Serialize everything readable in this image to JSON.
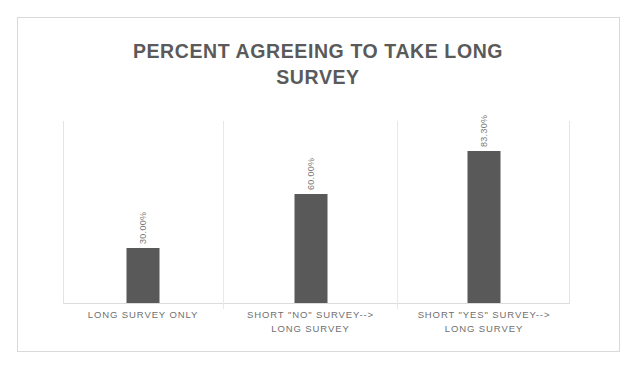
{
  "chart_data": {
    "type": "bar",
    "title": "PERCENT AGREEING TO TAKE LONG SURVEY",
    "title_line_1": "PERCENT AGREEING TO TAKE LONG",
    "title_line_2": "SURVEY",
    "categories": [
      "LONG SURVEY ONLY",
      "SHORT \"NO\" SURVEY--> LONG SURVEY",
      "SHORT \"YES\" SURVEY--> LONG SURVEY"
    ],
    "category_lines": [
      {
        "line_1": "LONG SURVEY ONLY",
        "line_2": ""
      },
      {
        "line_1": "SHORT \"NO\" SURVEY-->",
        "line_2": "LONG SURVEY"
      },
      {
        "line_1": "SHORT \"YES\" SURVEY-->",
        "line_2": "LONG SURVEY"
      }
    ],
    "values": [
      30.0,
      60.0,
      83.3
    ],
    "data_labels": [
      "30.00%",
      "60.00%",
      "83.30%"
    ],
    "xlabel": "",
    "ylabel": "",
    "ylim": [
      0,
      100
    ],
    "grid": false,
    "legend": false,
    "bar_color": "#595959",
    "title_color": "#5a5a5a",
    "label_color": "#7b7b7b",
    "category_label_color": "#6f6f6f",
    "axis_color": "#e4e4e4",
    "background_color": "#ffffff",
    "border_color": "#d9d9d9"
  }
}
